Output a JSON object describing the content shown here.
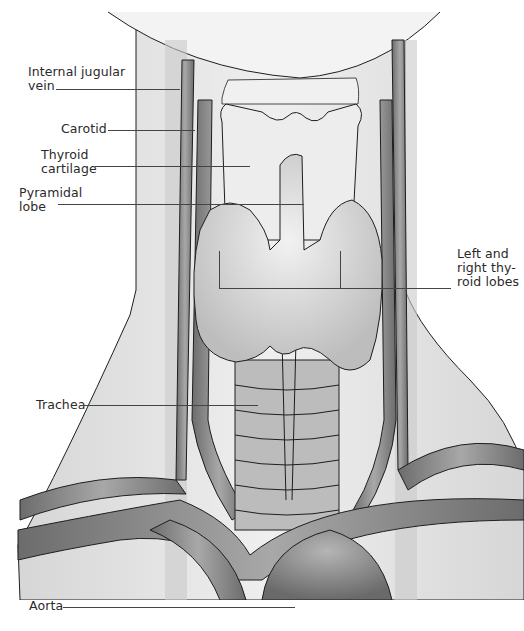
{
  "figure": {
    "colors": {
      "background": "#ffffff",
      "skin": "#e6e6e6",
      "vessel": "#8a8a8a",
      "vessel_dark": "#6e6e6e",
      "thyroid": "#d9d9d9",
      "cartilage": "#eeeeee",
      "outline": "#1e1e1e",
      "label_text": "#2a2a2a"
    }
  },
  "labels": {
    "internal_jugular_vein": "Internal jugular\nvein",
    "carotid": "Carotid",
    "thyroid_cartilage": "Thyroid\ncartilage",
    "pyramidal_lobe": "Pyramidal\nlobe",
    "thyroid_lobes": "Left and\nright thy-\nroid lobes",
    "trachea": "Trachea",
    "aorta": "Aorta"
  }
}
